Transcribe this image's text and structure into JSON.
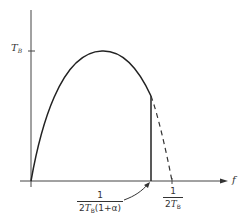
{
  "diagram": {
    "y_axis_tick_label": "T",
    "y_axis_tick_label_sub": "B",
    "x_axis_label": "f",
    "cutoff_label": {
      "numerator": "1",
      "denominator_prefix": "2",
      "denominator_symbol": "T",
      "denominator_sub": "B",
      "denominator_suffix": "(1+α)"
    },
    "nyquist_label": {
      "numerator": "1",
      "denominator_prefix": "2",
      "denominator_symbol": "T",
      "denominator_sub": "B"
    },
    "colors": {
      "stroke": "#333333",
      "background": "#ffffff"
    }
  }
}
